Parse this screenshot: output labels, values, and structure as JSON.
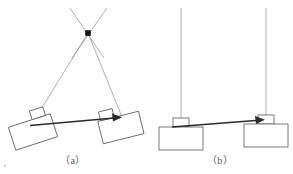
{
  "figure": {
    "background_color": "#ffffff",
    "line_color_thin": "#8a8a8a",
    "line_color_rod": "#2b2b2b",
    "block_stroke": "#6b6b6b",
    "pivot_color": "#111111",
    "panels": [
      {
        "id": "a",
        "caption": "（a）",
        "description": "two blocks hung from a common apex by two inclined cords, connected by a horizontal rod",
        "apex": {
          "x": 88,
          "y": 33,
          "marker": "filled-square-pivot"
        },
        "cords": [
          {
            "name": "cord-left",
            "x1": 88,
            "y1": 33,
            "x2": 31,
            "y2": 122
          },
          {
            "name": "cord-right",
            "x1": 88,
            "y1": 33,
            "x2": 122,
            "y2": 115
          },
          {
            "name": "cord-upper-left-extension",
            "x1": 88,
            "y1": 33,
            "x2": 70,
            "y2": 8
          },
          {
            "name": "cord-upper-right-extension",
            "x1": 88,
            "y1": 33,
            "x2": 107,
            "y2": 8
          }
        ],
        "rod": {
          "name": "connecting-rod",
          "x1": 30,
          "y1": 125,
          "x2": 121,
          "y2": 117,
          "arrow_end": "right"
        },
        "blocks": [
          {
            "name": "block-left",
            "tilt_deg": -18,
            "cx": 33,
            "cy": 132,
            "w": 44,
            "h": 24,
            "tab_w": 14,
            "tab_h": 9
          },
          {
            "name": "block-right",
            "tilt_deg": -14,
            "cx": 121,
            "cy": 128,
            "w": 42,
            "h": 23,
            "tab_w": 14,
            "tab_h": 9
          }
        ]
      },
      {
        "id": "b",
        "caption": "（b）",
        "description": "two blocks hung from vertical cords, connected by a horizontal rod",
        "cords": [
          {
            "name": "cord-left-vertical",
            "x1": 181,
            "y1": 8,
            "x2": 181,
            "y2": 122
          },
          {
            "name": "cord-right-vertical",
            "x1": 266,
            "y1": 8,
            "x2": 266,
            "y2": 122
          }
        ],
        "rod": {
          "name": "connecting-rod",
          "x1": 180,
          "y1": 127,
          "x2": 264,
          "y2": 120,
          "arrow_end": "right"
        },
        "blocks": [
          {
            "name": "block-left",
            "tilt_deg": 0,
            "cx": 181,
            "cy": 138,
            "w": 44,
            "h": 23,
            "tab_w": 16,
            "tab_h": 9
          },
          {
            "name": "block-right",
            "tilt_deg": 0,
            "cx": 266,
            "cy": 136,
            "w": 44,
            "h": 23,
            "tab_w": 16,
            "tab_h": 9
          }
        ]
      }
    ]
  }
}
